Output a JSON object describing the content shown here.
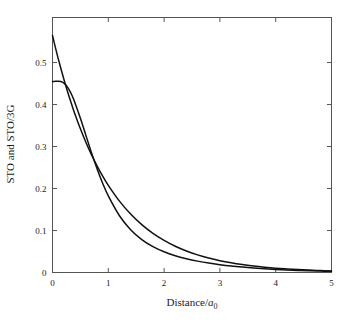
{
  "chart_data": {
    "type": "line",
    "title": "",
    "subtitle": "",
    "xlabel": "Distance/a0",
    "xlabel_parts": {
      "prefix": "Distance/",
      "symbol": "a",
      "subscript": "0"
    },
    "ylabel": "STO and STO/3G",
    "xlim": [
      0,
      5
    ],
    "ylim": [
      0,
      0.58
    ],
    "xticks": [
      0,
      1,
      2,
      3,
      4,
      5
    ],
    "xtick_labels": [
      "0",
      "1",
      "2",
      "3",
      "4",
      "5"
    ],
    "yticks": [
      0,
      0.1,
      0.2,
      0.3,
      0.4,
      0.5
    ],
    "ytick_labels": [
      "0",
      "0.1",
      "0.2",
      "0.3",
      "0.4",
      "0.5"
    ],
    "grid": false,
    "legend": "none",
    "frame": "box",
    "tick_direction": "in",
    "line_color": "#111111",
    "axis_color": "#555555",
    "background": "#ffffff",
    "x": [
      0.0,
      0.05,
      0.1,
      0.15,
      0.2,
      0.25,
      0.3,
      0.35,
      0.4,
      0.5,
      0.6,
      0.7,
      0.8,
      0.9,
      1.0,
      1.2,
      1.4,
      1.6,
      1.8,
      2.0,
      2.2,
      2.4,
      2.6,
      2.8,
      3.0,
      3.2,
      3.4,
      3.6,
      3.8,
      4.0,
      4.2,
      4.4,
      4.6,
      4.8,
      5.0
    ],
    "series": [
      {
        "name": "STO",
        "values": [
          0.5642,
          0.5367,
          0.5105,
          0.4856,
          0.4619,
          0.4394,
          0.4179,
          0.3975,
          0.3781,
          0.3422,
          0.3096,
          0.2802,
          0.2535,
          0.2294,
          0.2076,
          0.17,
          0.1391,
          0.1139,
          0.0932,
          0.0764,
          0.0625,
          0.0512,
          0.0419,
          0.0343,
          0.0281,
          0.023,
          0.0188,
          0.0154,
          0.0126,
          0.0103,
          0.0085,
          0.0069,
          0.0057,
          0.0047,
          0.0038
        ]
      },
      {
        "name": "STO/3G",
        "values": [
          0.4545,
          0.4551,
          0.4556,
          0.4549,
          0.4516,
          0.445,
          0.4348,
          0.4213,
          0.405,
          0.3672,
          0.3259,
          0.2848,
          0.2464,
          0.2121,
          0.1823,
          0.1352,
          0.1019,
          0.0785,
          0.0617,
          0.0494,
          0.0401,
          0.0329,
          0.0271,
          0.0224,
          0.0186,
          0.0154,
          0.0128,
          0.0106,
          0.0088,
          0.0073,
          0.006,
          0.005,
          0.0041,
          0.0034,
          0.0028
        ]
      }
    ],
    "annotations": [
      "STO curve has a cusp at r=0 with value ~0.564",
      "STO/3G curve is smooth at r=0 with value ~0.455 and a slight maximum near r=0.12",
      "Both curves converge for r greater than about 0.45 and decay toward 0 at r=5"
    ]
  }
}
